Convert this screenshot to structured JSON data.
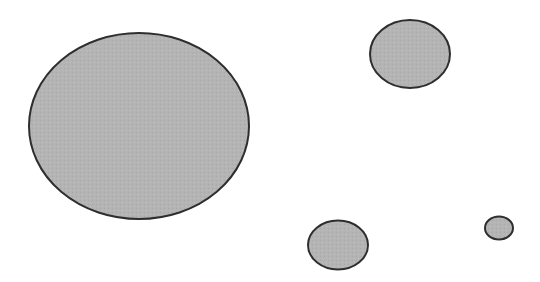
{
  "diagram": {
    "width": 540,
    "height": 282,
    "background": "#ffffff",
    "fill_color": "#b4b4b4",
    "stroke_color": "#2e2e2e",
    "stroke_width": 2,
    "shapes": [
      {
        "id": "large-ellipse",
        "type": "ellipse",
        "cx": 139,
        "cy": 126,
        "rx": 110,
        "ry": 93
      },
      {
        "id": "top-right-ellipse",
        "type": "ellipse",
        "cx": 410,
        "cy": 54,
        "rx": 40,
        "ry": 34
      },
      {
        "id": "bottom-middle-ellipse",
        "type": "ellipse",
        "cx": 338,
        "cy": 245,
        "rx": 30,
        "ry": 24.5
      },
      {
        "id": "small-ellipse",
        "type": "ellipse",
        "cx": 499,
        "cy": 228,
        "rx": 14,
        "ry": 11.5
      }
    ]
  }
}
